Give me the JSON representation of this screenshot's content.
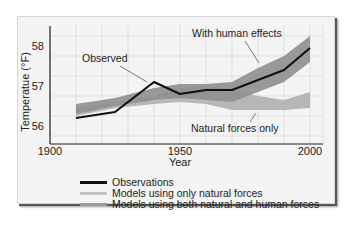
{
  "chart_data": {
    "type": "line",
    "title": "",
    "xlabel": "Year",
    "ylabel": "Temperatue (°F)",
    "xlim": [
      1900,
      2005
    ],
    "ylim": [
      55.6,
      58.5
    ],
    "x_ticks": [
      "1900",
      "1950",
      "2000"
    ],
    "y_ticks": [
      "56",
      "57",
      "58"
    ],
    "grid": true,
    "legend_position": "bottom",
    "series": [
      {
        "name": "Observations",
        "kind": "line",
        "color": "#111111",
        "x": [
          1910,
          1925,
          1940,
          1950,
          1960,
          1970,
          1980,
          1990,
          2000
        ],
        "values": [
          56.2,
          56.35,
          57.1,
          56.8,
          56.9,
          56.9,
          57.15,
          57.4,
          57.95
        ]
      },
      {
        "name": "Models using only natural forces",
        "kind": "band",
        "color": "#b3b3b3",
        "x": [
          1910,
          1925,
          1940,
          1950,
          1960,
          1970,
          1980,
          1990,
          2000
        ],
        "lower": [
          56.25,
          56.45,
          56.55,
          56.6,
          56.55,
          56.4,
          56.4,
          56.4,
          56.45
        ],
        "upper": [
          56.45,
          56.6,
          56.75,
          56.95,
          57.0,
          56.9,
          56.75,
          56.65,
          56.85
        ]
      },
      {
        "name": "Models using both natural and human forces",
        "kind": "band",
        "color": "#8f8f8f",
        "x": [
          1910,
          1925,
          1940,
          1950,
          1960,
          1970,
          1980,
          1990,
          2000
        ],
        "lower": [
          56.3,
          56.5,
          56.65,
          56.7,
          56.65,
          56.6,
          56.85,
          57.1,
          57.6
        ],
        "upper": [
          56.55,
          56.7,
          56.95,
          57.05,
          57.05,
          57.1,
          57.45,
          57.75,
          58.25
        ]
      }
    ],
    "annotations": [
      {
        "text": "Observed",
        "x": 1915,
        "y": 57.7
      },
      {
        "text": "With human effects",
        "x": 1965,
        "y": 58.15
      },
      {
        "text": "Natural forces only",
        "x": 1958,
        "y": 56.05
      }
    ]
  },
  "legend": {
    "items": [
      {
        "label": "Observations",
        "color": "#111111"
      },
      {
        "label": "Models using only natural forces",
        "color": "#c2c2c2"
      },
      {
        "label": "Models using both natural and human forces",
        "color": "#9a9a9a"
      }
    ]
  }
}
